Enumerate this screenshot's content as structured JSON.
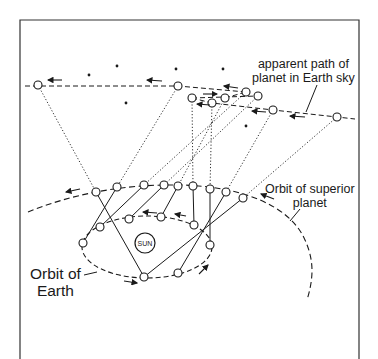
{
  "figure": {
    "type": "retrograde-motion-diagram",
    "labels": {
      "sky_path": [
        "apparent path of",
        "planet in Earth sky"
      ],
      "superior_orbit": [
        "Orbit of superior",
        "planet"
      ],
      "earth_orbit": [
        "Orbit of",
        "Earth"
      ],
      "sun": "SUN"
    },
    "colors": {
      "ink": "#1a1a1a",
      "background": "#ffffff",
      "frame": "#333333"
    },
    "sky_positions": [
      [
        38,
        85
      ],
      [
        178,
        86
      ],
      [
        246,
        92
      ],
      [
        258,
        96
      ],
      [
        225,
        98
      ],
      [
        192,
        98
      ],
      [
        212,
        103
      ],
      [
        273,
        110
      ],
      [
        337,
        117
      ]
    ],
    "planet_positions": [
      [
        96,
        192
      ],
      [
        117,
        187
      ],
      [
        144,
        185
      ],
      [
        164,
        185
      ],
      [
        178,
        186
      ],
      [
        193,
        186
      ],
      [
        210,
        189
      ],
      [
        226,
        192
      ],
      [
        243,
        198
      ]
    ],
    "earth_positions": [
      [
        83,
        243
      ],
      [
        100,
        227
      ],
      [
        129,
        219
      ],
      [
        161,
        217
      ],
      [
        194,
        225
      ],
      [
        210,
        245
      ],
      [
        178,
        273
      ],
      [
        144,
        277
      ]
    ],
    "stars": [
      [
        89,
        75
      ],
      [
        117,
        66
      ],
      [
        126,
        103
      ],
      [
        176,
        69
      ],
      [
        223,
        69
      ],
      [
        246,
        126
      ]
    ],
    "sun_center": [
      145,
      243
    ]
  }
}
